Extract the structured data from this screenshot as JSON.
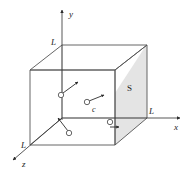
{
  "figure": {
    "type": "3d-cube-gas-diagram",
    "background_color": "#ffffff",
    "line_color": "#4a4a4a",
    "axis_color": "#3a3a3a",
    "shaded_face_color": "#e2e2e2",
    "particle_color": "#ffffff",
    "particle_stroke": "#555555"
  },
  "axes": [
    {
      "name": "y-axis",
      "label": "y",
      "direction": "up"
    },
    {
      "name": "x-axis",
      "label": "x",
      "direction": "right"
    },
    {
      "name": "z-axis",
      "label": "z",
      "direction": "down-left"
    }
  ],
  "dimension_labels": [
    {
      "name": "length-label-y",
      "label": "L",
      "position": "y-axis-top-corner"
    },
    {
      "name": "length-label-x",
      "label": "L",
      "position": "x-axis-right-corner"
    },
    {
      "name": "length-label-z",
      "label": "L",
      "position": "z-axis-front-corner"
    }
  ],
  "faces": [
    {
      "name": "face-S",
      "label": "S",
      "shaded": true,
      "position": "right"
    }
  ],
  "particles": [
    {
      "name": "particle-upper-left",
      "label": "",
      "velocity_direction": "up-right"
    },
    {
      "name": "particle-center",
      "label": "c",
      "velocity_direction": "up-right"
    },
    {
      "name": "particle-lower-left",
      "label": "",
      "velocity_direction": "up-left"
    },
    {
      "name": "particle-right",
      "label": "",
      "velocity_direction": "right"
    }
  ]
}
